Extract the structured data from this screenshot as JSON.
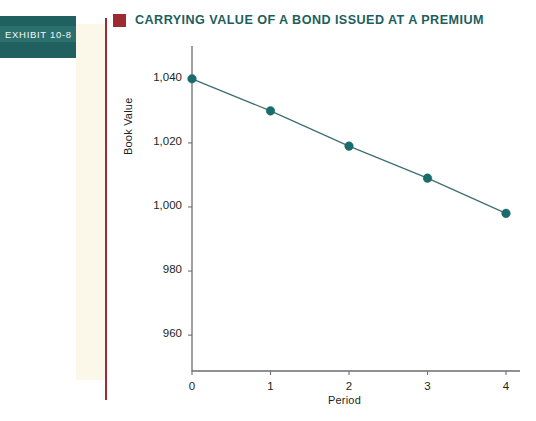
{
  "exhibit": {
    "tab_label": "EXHIBIT  10-8",
    "title": "CARRYING VALUE OF A BOND ISSUED AT A PREMIUM",
    "marker_icon": "square-marker-icon",
    "colors": {
      "tab_background": "#20605f",
      "tab_band": "#2c706d",
      "title_text": "#1d5f5e",
      "marker": "#9c2b32",
      "rule": "#9c2b32",
      "panel": "#fcf8e9",
      "series": "#1a6b6b",
      "axis": "#6d6e71"
    }
  },
  "chart_data": {
    "type": "line",
    "title": "CARRYING VALUE OF A BOND ISSUED AT A PREMIUM",
    "xlabel": "Period",
    "ylabel": "Book Value",
    "x": [
      0,
      1,
      2,
      3,
      4
    ],
    "values": [
      1040,
      1030,
      1019,
      1009,
      998
    ],
    "xtick_labels": [
      "0",
      "1",
      "2",
      "3",
      "4"
    ],
    "ytick_labels": [
      "960",
      "980",
      "1,000",
      "1,020",
      "1,040"
    ],
    "ytick_values": [
      960,
      980,
      1000,
      1020,
      1040
    ],
    "xlim": [
      0,
      4
    ],
    "ylim": [
      950,
      1048
    ],
    "grid": false,
    "legend": "none",
    "marker": "circle",
    "series_color": "#1a6b6b",
    "line_color": "#3f6f72"
  }
}
